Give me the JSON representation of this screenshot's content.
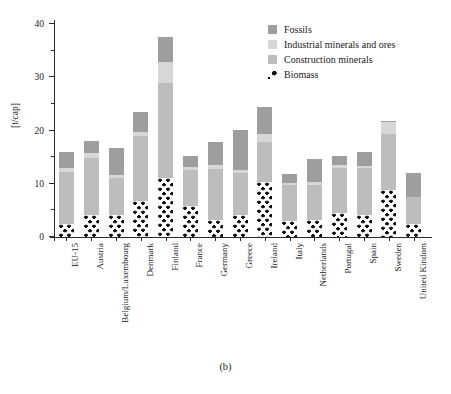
{
  "caption": "(b)",
  "axes": {
    "ylabel": "[t/cap]",
    "yticks": [
      0,
      10,
      20,
      30,
      40
    ],
    "yminor": [
      5,
      15,
      25,
      35
    ],
    "ylim": [
      0,
      40
    ]
  },
  "legend": {
    "position": "top-right",
    "items": [
      {
        "label": "Fossils",
        "color": "#9e9e9e",
        "swatch": "fossils-swatch"
      },
      {
        "label": "Industrial minerals and ores",
        "color": "#d7d7d7",
        "swatch": "industrial-swatch"
      },
      {
        "label": "Construction minerals",
        "color": "#bdbdbd",
        "swatch": "construction-swatch"
      },
      {
        "label": "Biomass",
        "color": "#111111",
        "swatch": "biomass-swatch"
      }
    ]
  },
  "chart_data": {
    "type": "bar",
    "subtype": "stacked",
    "title": "",
    "xlabel": "",
    "ylabel": "[t/cap]",
    "ylim": [
      0,
      40
    ],
    "yticks": [
      0,
      10,
      20,
      30,
      40
    ],
    "grid": false,
    "legend_position": "top-right",
    "categories": [
      "EU-15",
      "Austria",
      "Belgium/Luxembourg",
      "Denmark",
      "Finland",
      "France",
      "Germany",
      "Greece",
      "Ireland",
      "Italy",
      "Netherlands",
      "Portugal",
      "Spain",
      "Sweden",
      "United Kindom"
    ],
    "series": [
      {
        "name": "Biomass",
        "color": "#111111",
        "values": [
          2.5,
          4.2,
          4.2,
          6.7,
          11.0,
          5.9,
          3.2,
          4.2,
          10.3,
          3.1,
          3.2,
          4.6,
          4.1,
          8.8,
          2.4
        ]
      },
      {
        "name": "Construction minerals",
        "color": "#bdbdbd",
        "values": [
          9.7,
          10.6,
          6.9,
          12.3,
          18.0,
          6.7,
          9.6,
          7.8,
          7.6,
          6.7,
          6.6,
          8.4,
          8.9,
          10.5,
          5.1
        ]
      },
      {
        "name": "Industrial minerals and ores",
        "color": "#d7d7d7",
        "values": [
          0.7,
          0.9,
          0.5,
          0.8,
          3.8,
          0.6,
          0.7,
          0.6,
          1.5,
          0.4,
          0.5,
          0.5,
          0.4,
          2.3,
          0.0
        ]
      },
      {
        "name": "Fossils",
        "color": "#9e9e9e",
        "values": [
          3.0,
          2.3,
          5.1,
          3.7,
          4.7,
          2.1,
          4.3,
          7.5,
          5.1,
          1.6,
          4.4,
          1.7,
          2.5,
          0.2,
          4.5
        ]
      }
    ],
    "totals": [
      15.9,
      18.0,
      16.7,
      23.5,
      37.5,
      15.3,
      17.8,
      20.1,
      24.5,
      11.8,
      14.7,
      15.2,
      15.9,
      21.8,
      12.0
    ]
  }
}
